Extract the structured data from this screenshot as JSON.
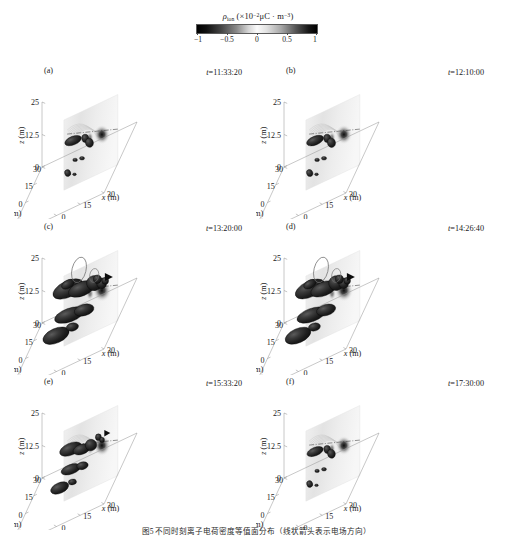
{
  "figure": {
    "caption": "图5  不同时刻离子电荷密度等值面分布（线状箭头表示电场方向）",
    "width": 513,
    "height": 542
  },
  "colorbar": {
    "quantity_symbol": "ρ",
    "quantity_subscript": "ion",
    "unit_prefix": "×10",
    "unit_exponent": "−2",
    "unit_body": "μC · m",
    "unit_exponent2": "−3",
    "title_full": "ρion (×10⁻²μC · m⁻³)",
    "ticks": [
      "−1",
      "−0.5",
      "0",
      "0.5",
      "1"
    ],
    "tick_values": [
      -1,
      -0.5,
      0,
      0.5,
      1
    ],
    "vmin": -1,
    "vmax": 1,
    "colors": {
      "low": "#000000",
      "mid": "#fbfbfb",
      "high": "#000000",
      "outline": "#5a5a5a"
    }
  },
  "axes": {
    "x_label": "x (m)",
    "y_label": "y (m)",
    "z_label": "z (m)",
    "x_ticks": [
      "−30",
      "−15",
      "0",
      "15",
      "30"
    ],
    "y_ticks": [
      "30",
      "15",
      "0",
      "−15",
      "−30"
    ],
    "z_ticks": [
      "0",
      "12.5",
      "25"
    ],
    "x_range": [
      -30,
      30
    ],
    "y_range": [
      -30,
      30
    ],
    "z_range": [
      0,
      25
    ],
    "unit": "m"
  },
  "panels": [
    {
      "label": "(a)",
      "time_label": "t=11:33:20",
      "time": "11:33:20",
      "stage": "early",
      "blob_scale": 0.46
    },
    {
      "label": "(b)",
      "time_label": "t=12:10:00",
      "time": "12:10:00",
      "stage": "early",
      "blob_scale": 0.5
    },
    {
      "label": "(c)",
      "time_label": "t=13:20:00",
      "time": "13:20:00",
      "stage": "peak",
      "blob_scale": 1.0
    },
    {
      "label": "(d)",
      "time_label": "t=14:26:40",
      "time": "14:26:40",
      "stage": "peak",
      "blob_scale": 0.95
    },
    {
      "label": "(e)",
      "time_label": "t=15:33:20",
      "time": "15:33:20",
      "stage": "decay",
      "blob_scale": 0.74
    },
    {
      "label": "(f)",
      "time_label": "t=17:30:00",
      "time": "17:30:00",
      "stage": "late",
      "blob_scale": 0.42
    }
  ],
  "chart_data": {
    "type": "heatmap",
    "subtitle": "3D isosurface distribution of ion charge density at six time instants",
    "xlabel": "x (m)",
    "ylabel": "y (m)",
    "zlabel": "z (m)",
    "xlim": [
      -30,
      30
    ],
    "ylim": [
      -30,
      30
    ],
    "zlim": [
      0,
      25
    ],
    "xticks": [
      -30,
      -15,
      0,
      15,
      30
    ],
    "yticks": [
      30,
      15,
      0,
      -15,
      -30
    ],
    "zticks": [
      0,
      12.5,
      25
    ],
    "grid": false,
    "legend": "colorbar",
    "legend_position": "top-center",
    "colormap": "gray-diverging",
    "cbar_range": [
      -1,
      1
    ],
    "cbar_ticks": [
      -1,
      -0.5,
      0,
      0.5,
      1
    ],
    "cbar_unit": "×10⁻² μC·m⁻³",
    "panel_count": 6,
    "panel_layout": [
      2,
      3
    ],
    "series": [
      {
        "name": "(a) t=11:33:20",
        "isosurface_count": 7,
        "peak_density": 0.48,
        "spatial_extent_m": 18,
        "vertical_extent_m": 12
      },
      {
        "name": "(b) t=12:10:00",
        "isosurface_count": 8,
        "peak_density": 0.55,
        "spatial_extent_m": 20,
        "vertical_extent_m": 13
      },
      {
        "name": "(c) t=13:20:00",
        "isosurface_count": 11,
        "peak_density": 1.0,
        "spatial_extent_m": 42,
        "vertical_extent_m": 24
      },
      {
        "name": "(d) t=14:26:40",
        "isosurface_count": 10,
        "peak_density": 0.94,
        "spatial_extent_m": 40,
        "vertical_extent_m": 23
      },
      {
        "name": "(e) t=15:33:20",
        "isosurface_count": 9,
        "peak_density": 0.76,
        "spatial_extent_m": 33,
        "vertical_extent_m": 19
      },
      {
        "name": "(f) t=17:30:00",
        "isosurface_count": 7,
        "peak_density": 0.44,
        "spatial_extent_m": 17,
        "vertical_extent_m": 11
      }
    ]
  }
}
